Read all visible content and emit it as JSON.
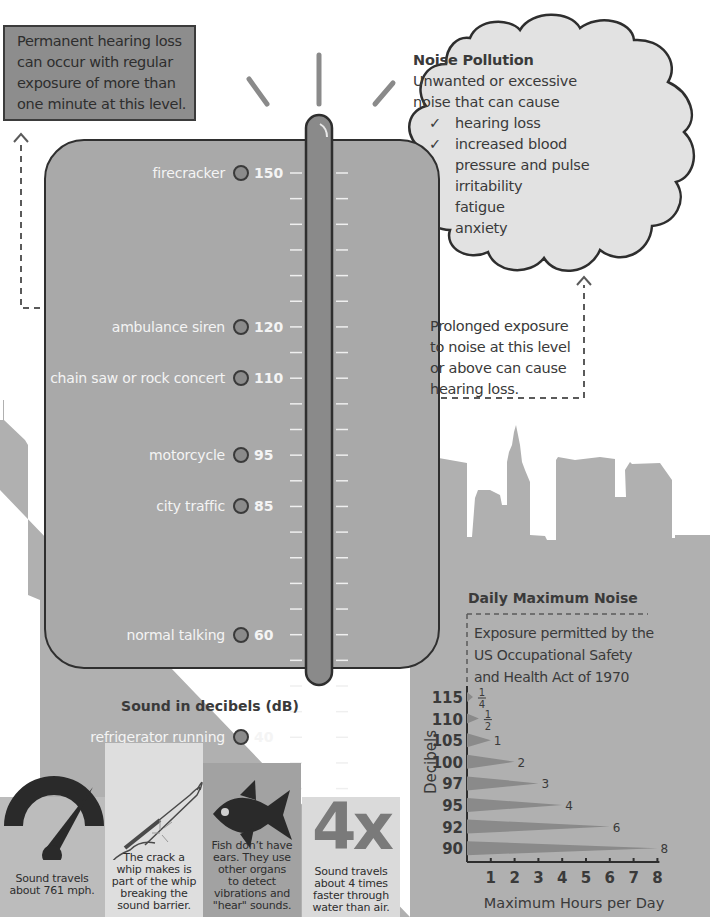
{
  "warning_box": {
    "lines": [
      "Permanent hearing loss",
      "can occur with regular",
      "exposure of more than",
      "one minute at this level."
    ]
  },
  "noise_pollution": {
    "title": "Noise Pollution",
    "intro_lines": [
      "Unwanted or excessive",
      "noise that can cause"
    ],
    "check_icon": "checkmark-icon",
    "effects": [
      {
        "lines": [
          "hearing loss"
        ]
      },
      {
        "lines": [
          "increased blood",
          "pressure and pulse"
        ]
      },
      {
        "lines": [
          "irritability"
        ]
      },
      {
        "lines": [
          "fatigue"
        ]
      },
      {
        "lines": [
          "anxiety"
        ]
      }
    ]
  },
  "prolonged_note": {
    "lines": [
      "Prolonged exposure",
      "to noise at this level",
      "or above can cause",
      "hearing loss."
    ]
  },
  "decibel_scale": {
    "title": "Sound in decibels (dB)",
    "thermometer_level_db": 150,
    "sounds": [
      {
        "label": "firecracker",
        "db": "150"
      },
      {
        "label": "ambulance siren",
        "db": "120"
      },
      {
        "label": "chain saw or rock concert",
        "db": "110"
      },
      {
        "label": "motorcycle",
        "db": "95"
      },
      {
        "label": "city traffic",
        "db": "85"
      },
      {
        "label": "normal talking",
        "db": "60"
      },
      {
        "label": "refrigerator running",
        "db": "40"
      },
      {
        "label": "whisper",
        "db": "30"
      }
    ]
  },
  "facts": [
    {
      "icon": "speedometer-icon",
      "lines": [
        "Sound travels",
        "about 761 mph."
      ]
    },
    {
      "icon": "whip-icon",
      "lines": [
        "The crack a",
        "whip makes is",
        "part of the whip",
        "breaking the",
        "sound barrier."
      ]
    },
    {
      "icon": "fish-icon",
      "lines": [
        "Fish don’t have",
        "ears. They use",
        "other organs",
        "to detect",
        "vibrations and",
        "\"hear\" sounds."
      ]
    },
    {
      "icon": "four-x-icon",
      "big_text": "4x",
      "lines": [
        "Sound travels",
        "about 4 times",
        "faster through",
        "water than air."
      ]
    }
  ],
  "daily_max": {
    "title": "Daily Maximum Noise",
    "subtitle_lines": [
      "Exposure permitted by the",
      "US Occupational Safety",
      "and Health Act of 1970"
    ]
  },
  "chart_data": {
    "type": "bar",
    "orientation": "horizontal",
    "title": "Daily Maximum Noise",
    "subtitle": "Exposure permitted by the US Occupational Safety and Health Act of 1970",
    "xlabel": "Maximum Hours per Day",
    "ylabel": "Decibels",
    "categories": [
      "115",
      "110",
      "105",
      "100",
      "97",
      "95",
      "92",
      "90"
    ],
    "values": [
      0.25,
      0.5,
      1,
      2,
      3,
      4,
      6,
      8
    ],
    "value_labels": [
      "1/4",
      "1/2",
      "1",
      "2",
      "3",
      "4",
      "6",
      "8"
    ],
    "x_ticks": [
      "1",
      "2",
      "3",
      "4",
      "5",
      "6",
      "7",
      "8"
    ],
    "xlim": [
      0,
      8
    ],
    "grid": false,
    "legend": "none"
  }
}
